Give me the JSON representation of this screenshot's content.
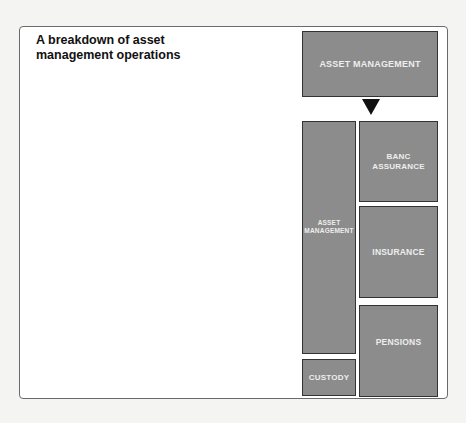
{
  "title": "A breakdown of asset management operations",
  "diagram": {
    "top_box": "ASSET MANAGEMENT",
    "arrow": "down-arrow",
    "left_column": [
      {
        "label": "ASSET MANAGEMENT"
      },
      {
        "label": "CUSTODY"
      }
    ],
    "right_column": [
      {
        "label": "BANC ASSURANCE"
      },
      {
        "label": "INSURANCE"
      },
      {
        "label": "PENSIONS"
      }
    ]
  },
  "colors": {
    "box_fill": "#8c8c8c",
    "box_border": "#333333",
    "box_text": "#eeeeee",
    "arrow": "#111111"
  }
}
